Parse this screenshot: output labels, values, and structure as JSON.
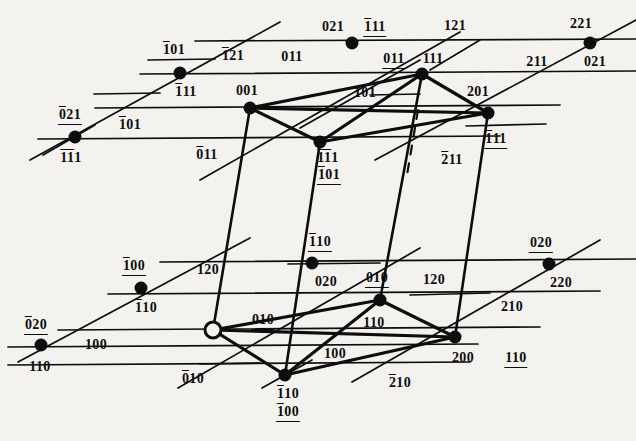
{
  "figure": {
    "type": "crystallographic-lattice-diagram",
    "background_color": "#f3f2ee",
    "ink_color": "#0d0d0d",
    "width": 636,
    "height": 441
  },
  "nodes": [
    {
      "id": "n-upper-021-1b11",
      "x": 352,
      "y": 43,
      "style": "filled",
      "labels": [
        "021",
        "-111"
      ]
    },
    {
      "id": "n-upper-221-021u",
      "x": 590,
      "y": 43,
      "style": "filled",
      "labels": [
        "221",
        "021_u"
      ]
    },
    {
      "id": "n-upper-1b01-1b11",
      "x": 180,
      "y": 73,
      "style": "filled",
      "labels": [
        "-101_u",
        "-111"
      ]
    },
    {
      "id": "n-upper-011-111",
      "x": 422,
      "y": 74,
      "style": "filled",
      "labels": [
        "011_u",
        "111"
      ]
    },
    {
      "id": "n-upper-0b21-1b1b1",
      "x": 75,
      "y": 137,
      "style": "filled",
      "labels": [
        "0-21_u",
        "-1-11"
      ]
    },
    {
      "id": "n-upper-001",
      "x": 250,
      "y": 108,
      "style": "filled",
      "labels": [
        "001"
      ]
    },
    {
      "id": "n-upper-201-1b11",
      "x": 488,
      "y": 113,
      "style": "filled",
      "labels": [
        "201",
        "-111_u"
      ]
    },
    {
      "id": "n-upper-1b1b1-1b01",
      "x": 320,
      "y": 142,
      "style": "filled",
      "labels": [
        "-1-11",
        "-101_u2"
      ]
    },
    {
      "id": "n-lower-1b00-1b10",
      "x": 141,
      "y": 288,
      "style": "filled",
      "labels": [
        "-100_u",
        "-110"
      ]
    },
    {
      "id": "n-lower-1b10-020",
      "x": 312,
      "y": 263,
      "style": "filled",
      "labels": [
        "-110_u",
        "020"
      ]
    },
    {
      "id": "n-lower-0b20-1b10",
      "x": 41,
      "y": 345,
      "style": "filled",
      "labels": [
        "0-20_u",
        "-110b"
      ]
    },
    {
      "id": "n-lower-origin",
      "x": 213,
      "y": 330,
      "style": "open",
      "labels": []
    },
    {
      "id": "n-lower-010-110",
      "x": 380,
      "y": 300,
      "style": "filled",
      "labels": [
        "010_u",
        "110"
      ]
    },
    {
      "id": "n-lower-020-220",
      "x": 549,
      "y": 264,
      "style": "filled",
      "labels": [
        "020_u",
        "220"
      ]
    },
    {
      "id": "n-lower-1b10-1b00",
      "x": 285,
      "y": 375,
      "style": "filled",
      "labels": [
        "-110",
        "-100_u2"
      ]
    },
    {
      "id": "n-lower-200",
      "x": 455,
      "y": 337,
      "style": "filled",
      "labels": [
        "200",
        "110_u"
      ]
    }
  ],
  "labels": [
    {
      "name": "label-1b01-upper",
      "text": "101",
      "over": "1",
      "under": "01",
      "x": 174,
      "y": 50
    },
    {
      "name": "label-1b21",
      "text": "121",
      "over": "1",
      "under": "",
      "x": 233,
      "y": 56
    },
    {
      "name": "label-011-top",
      "text": "011",
      "over": "",
      "under": "",
      "x": 292,
      "y": 57
    },
    {
      "name": "label-021-top",
      "text": "021",
      "over": "",
      "under": "",
      "x": 333,
      "y": 27
    },
    {
      "name": "label-1b11-top",
      "text": "111",
      "over": "1",
      "under": "11",
      "x": 375,
      "y": 27
    },
    {
      "name": "label-121-top",
      "text": "121",
      "over": "",
      "under": "",
      "x": 455,
      "y": 26
    },
    {
      "name": "label-221-top",
      "text": "221",
      "over": "",
      "under": "",
      "x": 581,
      "y": 24
    },
    {
      "name": "label-011-under",
      "text": "011",
      "over": "",
      "under": "011",
      "x": 394,
      "y": 59
    },
    {
      "name": "label-111",
      "text": "111",
      "over": "",
      "under": "",
      "x": 433,
      "y": 59
    },
    {
      "name": "label-211",
      "text": "211",
      "over": "",
      "under": "211",
      "x": 537,
      "y": 62
    },
    {
      "name": "label-021-right",
      "text": "021",
      "over": "",
      "under": "021",
      "x": 595,
      "y": 62
    },
    {
      "name": "label-1b11-left",
      "text": "111",
      "over": "1",
      "under": "",
      "x": 186,
      "y": 92
    },
    {
      "name": "label-001",
      "text": "001",
      "over": "",
      "under": "",
      "x": 247,
      "y": 91
    },
    {
      "name": "label-101",
      "text": "101",
      "over": "",
      "under": "",
      "x": 365,
      "y": 93
    },
    {
      "name": "label-201",
      "text": "201",
      "over": "",
      "under": "",
      "x": 478,
      "y": 92
    },
    {
      "name": "label-0b21",
      "text": "021",
      "over": "2",
      "under": "021",
      "x": 70,
      "y": 115
    },
    {
      "name": "label-1b01-mid",
      "text": "101",
      "over": "1",
      "under": "",
      "x": 130,
      "y": 125
    },
    {
      "name": "label-1b11-nodeL",
      "text": "111",
      "over": "11",
      "under": "",
      "x": 71,
      "y": 158
    },
    {
      "name": "label-0b11",
      "text": "011",
      "over": "1",
      "under": "",
      "x": 207,
      "y": 155
    },
    {
      "name": "label-1b1b1-node",
      "text": "111",
      "over": "11",
      "under": "",
      "x": 328,
      "y": 158
    },
    {
      "name": "label-1b01-node",
      "text": "101",
      "over": "1",
      "under": "101",
      "x": 329,
      "y": 175
    },
    {
      "name": "label-2b11",
      "text": "211",
      "over": "1",
      "under": "",
      "x": 452,
      "y": 160
    },
    {
      "name": "label-1b11-right",
      "text": "111",
      "over": "1",
      "under": "111",
      "x": 496,
      "y": 139
    },
    {
      "name": "label-1b10-node",
      "text": "110",
      "over": "1",
      "under": "110",
      "x": 320,
      "y": 242
    },
    {
      "name": "label-020-right",
      "text": "020",
      "over": "",
      "under": "020",
      "x": 541,
      "y": 243
    },
    {
      "name": "label-1b00",
      "text": "100",
      "over": "1",
      "under": "100",
      "x": 134,
      "y": 266
    },
    {
      "name": "label-1b20",
      "text": "120",
      "over": "1",
      "under": "",
      "x": 208,
      "y": 270
    },
    {
      "name": "label-020-mid",
      "text": "020",
      "over": "",
      "under": "",
      "x": 326,
      "y": 282
    },
    {
      "name": "label-010-node",
      "text": "010",
      "over": "",
      "under": "010",
      "x": 377,
      "y": 278
    },
    {
      "name": "label-120-right",
      "text": "120",
      "over": "",
      "under": "",
      "x": 434,
      "y": 280
    },
    {
      "name": "label-220",
      "text": "220",
      "over": "",
      "under": "",
      "x": 561,
      "y": 283
    },
    {
      "name": "label-1b10-left",
      "text": "110",
      "over": "1",
      "under": "",
      "x": 146,
      "y": 308
    },
    {
      "name": "label-010-mid",
      "text": "010",
      "over": "",
      "under": "010",
      "x": 263,
      "y": 320
    },
    {
      "name": "label-110",
      "text": "110",
      "over": "",
      "under": "",
      "x": 374,
      "y": 323
    },
    {
      "name": "label-210-right",
      "text": "210",
      "over": "",
      "under": "",
      "x": 512,
      "y": 307
    },
    {
      "name": "label-0b20",
      "text": "020",
      "over": "2",
      "under": "020",
      "x": 36,
      "y": 325
    },
    {
      "name": "label-100-left",
      "text": "100",
      "over": "",
      "under": "",
      "x": 96,
      "y": 345
    },
    {
      "name": "label-100-mid",
      "text": "100",
      "over": "",
      "under": "",
      "x": 335,
      "y": 354
    },
    {
      "name": "label-200",
      "text": "200",
      "over": "",
      "under": "",
      "x": 463,
      "y": 358
    },
    {
      "name": "label-110-right",
      "text": "110",
      "over": "",
      "under": "110",
      "x": 516,
      "y": 358
    },
    {
      "name": "label-1b10-bottom",
      "text": "110",
      "over": "",
      "under": "",
      "x": 40,
      "y": 367
    },
    {
      "name": "label-0b10",
      "text": "010",
      "over": "1",
      "under": "",
      "x": 193,
      "y": 379
    },
    {
      "name": "label-1b10-node2",
      "text": "110",
      "over": "1",
      "under": "",
      "x": 288,
      "y": 394
    },
    {
      "name": "label-1b00-node2",
      "text": "100",
      "over": "1",
      "under": "100",
      "x": 288,
      "y": 412
    },
    {
      "name": "label-2b10",
      "text": "210",
      "over": "1",
      "under": "",
      "x": 400,
      "y": 383
    }
  ],
  "lines": {
    "note": "horizontal trace lines, oblique trace lines, heavy polyhedron edges, vertical connectors, dashed hidden edge"
  }
}
